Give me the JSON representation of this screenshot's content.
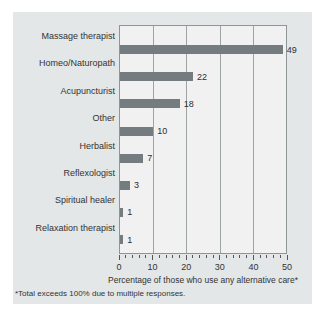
{
  "chart_data": {
    "type": "bar",
    "orientation": "horizontal",
    "title": "",
    "categories": [
      "Massage therapist",
      "Homeo/Naturopath",
      "Acupuncturist",
      "Other",
      "Herbalist",
      "Reflexologist",
      "Spiritual healer",
      "Relaxation therapist"
    ],
    "values": [
      49,
      22,
      18,
      10,
      7,
      3,
      1,
      1
    ],
    "xlabel": "Percentage of those who use any alternative care*",
    "xlim": [
      0,
      50
    ],
    "xticks": [
      0,
      10,
      20,
      30,
      40,
      50
    ],
    "minor_tick_step": 2,
    "grid": "vertical-major",
    "legend": "none",
    "colors": {
      "bar": "#747c7f",
      "panel_bg": "#e3e7e8",
      "plot_bg": "#f0f1f0",
      "grid": "#9ea4a4",
      "plot_border": "#8e9596",
      "tick": "#555555",
      "text": "#333333"
    }
  },
  "footnote": "*Total exceeds 100% due to multiple responses."
}
